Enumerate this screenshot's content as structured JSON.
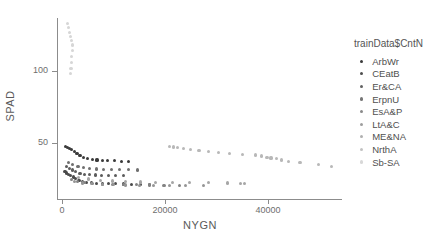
{
  "chart_data": {
    "type": "scatter",
    "title": "",
    "xlabel": "NYGN",
    "ylabel": "SPAD",
    "xlim": [
      0,
      55000
    ],
    "ylim": [
      0,
      140
    ],
    "xticks": [
      0,
      20000,
      40000
    ],
    "xtick_labels": [
      "0",
      "20000",
      "40000"
    ],
    "yticks": [
      50,
      100
    ],
    "ytick_labels": [
      "50",
      "100"
    ],
    "grid": false,
    "legend": {
      "title": "trainData$CntN",
      "position": "right",
      "entries": [
        {
          "label": "ArbWr",
          "color": "#3a3a3a"
        },
        {
          "label": "CEatB",
          "color": "#4e4e4e"
        },
        {
          "label": "Er&CA",
          "color": "#626262"
        },
        {
          "label": "ErpnU",
          "color": "#767676"
        },
        {
          "label": "EsA&P",
          "color": "#8a8a8a"
        },
        {
          "label": "LtA&C",
          "color": "#9e9e9e"
        },
        {
          "label": "ME&NA",
          "color": "#b0b0b0"
        },
        {
          "label": "NrthA",
          "color": "#c2c2c2"
        },
        {
          "label": "Sb-SA",
          "color": "#d8d8d8"
        }
      ]
    },
    "series": [
      {
        "name": "ArbWr",
        "color": "#3a3a3a",
        "points": [
          [
            700,
            47.5
          ],
          [
            1100,
            46.8
          ],
          [
            1500,
            46.0
          ],
          [
            1900,
            45.2
          ],
          [
            2400,
            44.0
          ],
          [
            2900,
            42.6
          ],
          [
            3500,
            41.2
          ],
          [
            4200,
            40.0
          ],
          [
            5000,
            39.2
          ],
          [
            5900,
            38.6
          ],
          [
            6800,
            38.2
          ],
          [
            7800,
            38.0
          ],
          [
            8900,
            37.8
          ],
          [
            10200,
            37.6
          ],
          [
            11500,
            37.4
          ],
          [
            12900,
            37.2
          ]
        ]
      },
      {
        "name": "CEatB",
        "color": "#4a4a4a",
        "points": [
          [
            600,
            30.0
          ],
          [
            900,
            29.2
          ],
          [
            1300,
            28.4
          ],
          [
            1700,
            27.5
          ],
          [
            2200,
            26.4
          ],
          [
            2700,
            25.2
          ],
          [
            3300,
            24.2
          ],
          [
            4000,
            23.4
          ],
          [
            4800,
            22.8
          ],
          [
            5700,
            22.4
          ],
          [
            6700,
            22.1
          ],
          [
            7800,
            21.9
          ],
          [
            9000,
            21.7
          ],
          [
            10400,
            21.6
          ],
          [
            11900,
            21.5
          ],
          [
            13500,
            21.4
          ],
          [
            15200,
            21.3
          ],
          [
            17000,
            21.2
          ]
        ]
      },
      {
        "name": "Er&CA",
        "color": "#5c5c5c",
        "points": [
          [
            800,
            33.6
          ],
          [
            1400,
            32.4
          ],
          [
            2000,
            31.2
          ],
          [
            2700,
            30.0
          ],
          [
            3500,
            29.0
          ],
          [
            4400,
            28.4
          ],
          [
            5400,
            28.0
          ],
          [
            6500,
            27.8
          ],
          [
            7700,
            27.6
          ],
          [
            9000,
            27.4
          ],
          [
            10400,
            27.3
          ],
          [
            11900,
            27.2
          ]
        ]
      },
      {
        "name": "ErpnU",
        "color": "#707070",
        "points": [
          [
            1200,
            36.5
          ],
          [
            2100,
            35.0
          ],
          [
            3100,
            33.8
          ],
          [
            4200,
            33.0
          ],
          [
            5400,
            32.4
          ],
          [
            6700,
            32.0
          ],
          [
            8100,
            31.8
          ],
          [
            9600,
            31.6
          ],
          [
            11200,
            31.5
          ],
          [
            12900,
            31.4
          ],
          [
            14700,
            31.3
          ]
        ]
      },
      {
        "name": "EsA&P",
        "color": "#838383",
        "points": [
          [
            1800,
            24.4
          ],
          [
            3000,
            23.2
          ],
          [
            4400,
            22.4
          ],
          [
            6000,
            21.8
          ],
          [
            7800,
            21.4
          ],
          [
            9800,
            21.2
          ],
          [
            12000,
            21.0
          ],
          [
            14400,
            20.9
          ],
          [
            17000,
            20.8
          ],
          [
            19800,
            20.7
          ],
          [
            22800,
            20.6
          ]
        ]
      },
      {
        "name": "LtA&C",
        "color": "#959595",
        "points": [
          [
            2400,
            23.0
          ],
          [
            4000,
            22.2
          ],
          [
            5800,
            21.6
          ],
          [
            7800,
            21.2
          ],
          [
            10000,
            21.0
          ],
          [
            12400,
            20.8
          ],
          [
            15000,
            20.7
          ],
          [
            17800,
            20.6
          ],
          [
            20800,
            20.5
          ],
          [
            24000,
            20.4
          ],
          [
            27400,
            20.3
          ]
        ]
      },
      {
        "name": "ME&NA",
        "color": "#a6a6a6",
        "points": [
          [
            3200,
            26.0
          ],
          [
            5200,
            25.0
          ],
          [
            7400,
            24.2
          ],
          [
            9800,
            23.6
          ],
          [
            12400,
            23.2
          ],
          [
            15200,
            22.9
          ],
          [
            18200,
            22.7
          ],
          [
            21400,
            22.5
          ],
          [
            24800,
            22.4
          ],
          [
            28400,
            22.3
          ],
          [
            32200,
            22.2
          ],
          [
            34600,
            22.0
          ],
          [
            35400,
            21.6
          ]
        ]
      },
      {
        "name": "NrthA",
        "color": "#b8b8b8",
        "points": [
          [
            20800,
            47.8
          ],
          [
            21600,
            47.2
          ],
          [
            22400,
            46.6
          ],
          [
            23600,
            46.0
          ],
          [
            25000,
            45.2
          ],
          [
            26600,
            44.6
          ],
          [
            28400,
            44.0
          ],
          [
            30400,
            43.4
          ],
          [
            32600,
            42.8
          ],
          [
            35000,
            42.2
          ],
          [
            37600,
            41.6
          ],
          [
            38800,
            41.0
          ],
          [
            39800,
            40.2
          ],
          [
            40600,
            39.6
          ],
          [
            41600,
            39.0
          ],
          [
            42600,
            38.2
          ],
          [
            44000,
            37.4
          ],
          [
            46200,
            36.4
          ],
          [
            49800,
            34.8
          ],
          [
            52400,
            33.6
          ]
        ]
      },
      {
        "name": "Sb-SA",
        "color": "#d6d6d6",
        "points": [
          [
            1100,
            133.0
          ],
          [
            1300,
            130.0
          ],
          [
            1500,
            127.0
          ],
          [
            1700,
            124.0
          ],
          [
            1900,
            121.0
          ],
          [
            2100,
            118.0
          ],
          [
            2000,
            114.0
          ],
          [
            1900,
            110.0
          ],
          [
            1800,
            106.0
          ],
          [
            1750,
            102.0
          ],
          [
            1700,
            98.0
          ]
        ]
      }
    ]
  }
}
